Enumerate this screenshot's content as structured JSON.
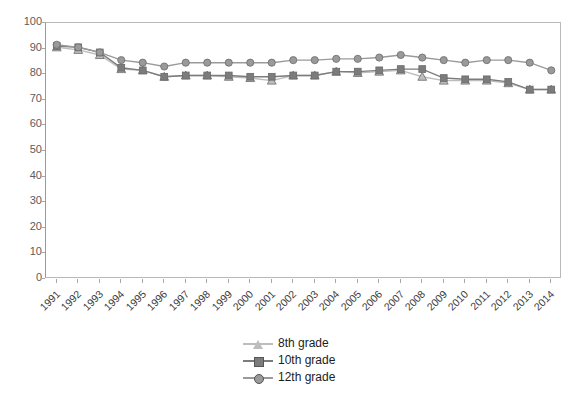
{
  "chart_data": {
    "type": "line",
    "title": "",
    "subtitle": "",
    "xlabel": "",
    "ylabel": "",
    "xlim": [
      1991,
      2014
    ],
    "ylim": [
      0,
      100
    ],
    "grid": false,
    "legend_position": "bottom-center",
    "x": [
      1991,
      1992,
      1993,
      1994,
      1995,
      1996,
      1997,
      1998,
      1999,
      2000,
      2001,
      2002,
      2003,
      2004,
      2005,
      2006,
      2007,
      2008,
      2009,
      2010,
      2011,
      2012,
      2013,
      2014
    ],
    "categories": [
      "1991",
      "1992",
      "1993",
      "1994",
      "1995",
      "1996",
      "1997",
      "1998",
      "1999",
      "2000",
      "2001",
      "2002",
      "2003",
      "2004",
      "2005",
      "2006",
      "2007",
      "2008",
      "2009",
      "2010",
      "2011",
      "2012",
      "2013",
      "2014"
    ],
    "yticks": [
      0,
      10,
      20,
      30,
      40,
      50,
      60,
      70,
      80,
      90,
      100
    ],
    "series": [
      {
        "name": "8th grade",
        "color": "#bdbdbd",
        "marker": "triangle",
        "values": [
          90.5,
          89.5,
          87.5,
          82.0,
          81.5,
          79.0,
          79.5,
          79.5,
          79.0,
          78.5,
          77.5,
          79.5,
          79.5,
          81.0,
          80.5,
          81.0,
          81.5,
          79.0,
          77.5,
          77.5,
          77.5,
          76.5,
          74.0,
          74.0
        ]
      },
      {
        "name": "10th grade",
        "color": "#7c7c7c",
        "marker": "square",
        "values": [
          91.0,
          90.5,
          88.5,
          82.5,
          81.5,
          79.0,
          79.5,
          79.5,
          79.5,
          79.0,
          79.0,
          79.5,
          79.5,
          81.0,
          81.0,
          81.5,
          82.0,
          82.0,
          78.5,
          78.0,
          78.0,
          77.0,
          74.0,
          74.0
        ]
      },
      {
        "name": "12th grade",
        "color": "#9a9a9a",
        "marker": "circle",
        "values": [
          91.5,
          90.5,
          88.5,
          85.5,
          84.5,
          83.0,
          84.5,
          84.5,
          84.5,
          84.5,
          84.5,
          85.5,
          85.5,
          86.0,
          86.0,
          86.5,
          87.5,
          86.5,
          85.5,
          84.5,
          85.5,
          85.5,
          84.5,
          81.5
        ]
      }
    ]
  },
  "legend": {
    "items": [
      {
        "label": "8th grade"
      },
      {
        "label": "10th grade"
      },
      {
        "label": "12th grade"
      }
    ]
  },
  "colors": {
    "series_8th": "#bdbdbd",
    "series_10th": "#7c7c7c",
    "series_12th": "#9a9a9a",
    "axis": "#a8a8a8",
    "frame": "#b9b9b9",
    "background": "#ffffff",
    "tick_text": "#5c5c5c",
    "label_text": "#3d3d3d"
  }
}
